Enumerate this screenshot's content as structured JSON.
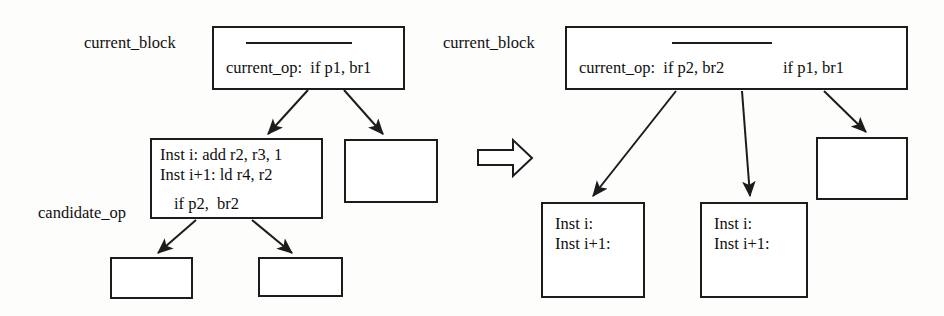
{
  "figure": {
    "transform_icon": "block-right-arrow-icon"
  },
  "before": {
    "current_block_label": "current_block",
    "candidate_op_label": "candidate_op",
    "current_block_box": {
      "divider": "————————",
      "op_text": "current_op:  if p1, br1"
    },
    "candidate_box": {
      "line1": "Inst i: add r2, r3, 1",
      "line2": "Inst i+1: ld r4, r2",
      "line3": "if p2,  br2"
    },
    "empty_boxes": [
      "",
      "",
      ""
    ]
  },
  "after": {
    "current_block_label": "current_block",
    "current_block_box": {
      "divider": "————————",
      "op_text": "current_op:  if p2, br2",
      "op_text_2": "if p1, br1"
    },
    "inst_box_left": {
      "line1": "Inst i:",
      "line2": "Inst i+1:"
    },
    "inst_box_right": {
      "line1": "Inst i:",
      "line2": "Inst i+1:"
    },
    "empty_boxes": [
      ""
    ]
  },
  "colors": {
    "stroke": "#1c1c1c",
    "background": "#fdfdfc",
    "text": "#101010"
  }
}
